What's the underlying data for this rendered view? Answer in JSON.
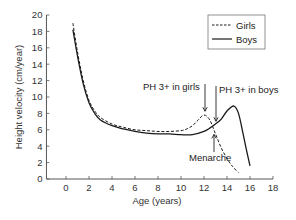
{
  "chart_data": {
    "type": "line",
    "title": "",
    "xlabel": "Age (years)",
    "ylabel": "Height velocity (cm/year)",
    "xlim": [
      -1.7,
      18
    ],
    "ylim": [
      0,
      20
    ],
    "x_ticks": [
      0,
      2,
      4,
      6,
      8,
      10,
      12,
      14,
      16,
      18
    ],
    "y_ticks": [
      0,
      2,
      4,
      6,
      8,
      10,
      12,
      14,
      16,
      18,
      20
    ],
    "grid": false,
    "legend_position": "upper right",
    "series": [
      {
        "name": "Girls",
        "style": "dashed",
        "points": [
          [
            0.6,
            19.0
          ],
          [
            1.0,
            15.5
          ],
          [
            1.5,
            12.0
          ],
          [
            2.0,
            9.6
          ],
          [
            2.5,
            8.3
          ],
          [
            3.0,
            7.5
          ],
          [
            4.0,
            6.7
          ],
          [
            5.0,
            6.3
          ],
          [
            6.0,
            6.0
          ],
          [
            7.0,
            5.9
          ],
          [
            8.0,
            5.8
          ],
          [
            9.0,
            5.8
          ],
          [
            10.0,
            5.9
          ],
          [
            10.5,
            6.1
          ],
          [
            11.0,
            6.5
          ],
          [
            11.5,
            7.2
          ],
          [
            12.0,
            7.8
          ],
          [
            12.5,
            7.2
          ],
          [
            13.0,
            5.5
          ],
          [
            13.5,
            3.8
          ],
          [
            14.0,
            2.5
          ],
          [
            14.5,
            1.5
          ],
          [
            15.0,
            0.8
          ]
        ]
      },
      {
        "name": "Boys",
        "style": "solid",
        "points": [
          [
            0.6,
            18.2
          ],
          [
            1.0,
            15.0
          ],
          [
            1.5,
            11.6
          ],
          [
            2.0,
            9.3
          ],
          [
            2.5,
            8.0
          ],
          [
            3.0,
            7.2
          ],
          [
            4.0,
            6.5
          ],
          [
            5.0,
            6.1
          ],
          [
            6.0,
            5.8
          ],
          [
            7.0,
            5.6
          ],
          [
            8.0,
            5.5
          ],
          [
            9.0,
            5.5
          ],
          [
            10.0,
            5.4
          ],
          [
            11.0,
            5.4
          ],
          [
            12.0,
            5.8
          ],
          [
            12.5,
            6.2
          ],
          [
            13.0,
            6.7
          ],
          [
            13.5,
            7.3
          ],
          [
            14.0,
            8.3
          ],
          [
            14.6,
            8.9
          ],
          [
            15.0,
            8.0
          ],
          [
            15.4,
            5.5
          ],
          [
            15.7,
            3.5
          ],
          [
            16.0,
            1.6
          ]
        ]
      }
    ],
    "annotations": [
      {
        "text": "PH 3+ in girls",
        "arrow_to_age": 12.0,
        "arrow_to_value": 7.9
      },
      {
        "text": "PH 3+ in boys",
        "arrow_to_age": 13.0,
        "arrow_to_value": 6.8
      },
      {
        "text": "Menarche",
        "arrow_to_age": 12.9,
        "arrow_to_value": 5.8
      }
    ]
  },
  "labels": {
    "xlabel": "Age (years)",
    "ylabel": "Height velocity (cm/year)",
    "legend_girls": "Girls",
    "legend_boys": "Boys",
    "annot_girls": "PH 3+ in girls",
    "annot_boys": "PH 3+ in boys",
    "annot_menarche": "Menarche"
  },
  "colors": {
    "line": "#1a1a1a",
    "axis": "#555555"
  }
}
